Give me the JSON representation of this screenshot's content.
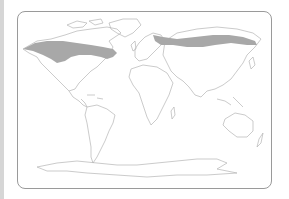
{
  "map": {
    "type": "world outline map",
    "projection": "equirectangular-like",
    "highlighted_region": "Boreal forest / taiga belt (North America and Eurasia)",
    "colors": {
      "background": "#ffffff",
      "land_outline": "#b4b4b4",
      "highlight_fill": "#a8a8a8",
      "frame_border": "#9a9a9a",
      "left_bar": "#d6d6d6"
    }
  }
}
